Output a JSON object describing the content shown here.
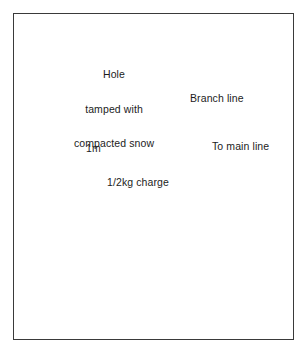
{
  "figure": {
    "title_visible": false,
    "background_color": "#ffffff",
    "frame_color": "#3a3a3a"
  },
  "labels": {
    "hole": {
      "line1": "Hole",
      "line2": "tamped with",
      "line3": "compacted snow"
    },
    "branch_line": "Branch line",
    "main_line": "To main line",
    "depth": "1m",
    "charge": "1/2kg charge"
  },
  "colors": {
    "snow_fill": "#a9a9a9",
    "snow_light": "#c2c2c2",
    "snow_shadow": "#8d8d8d",
    "rock_dark": "#3c3c3c",
    "rock_speck": "#9a9a9a",
    "line_black": "#111111",
    "text": "#1c1c1c"
  },
  "elements": {
    "charge_block": "explosive-charge",
    "bore_hole": "vertical-bore-hole",
    "dimension_arrow": "1m-depth-dimension",
    "detonating_wire": "branch-line-wire",
    "cornice": "snow-cornice",
    "rock_slope": "rock-slope"
  }
}
